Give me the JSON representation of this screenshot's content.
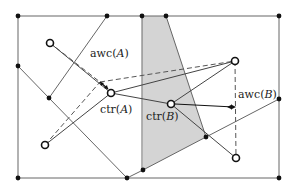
{
  "figure": {
    "colors": {
      "line": "#666666",
      "dark_line": "#444444",
      "shade": "#d4d4d4",
      "dot": "#111111",
      "label": "#222222"
    },
    "labels": {
      "awc_a_prefix": "awc(",
      "awc_a_var": "A",
      "awc_a_suffix": ")",
      "ctr_a_prefix": "ctr(",
      "ctr_a_var": "A",
      "ctr_a_suffix": ")",
      "ctr_b_prefix": "ctr(",
      "ctr_b_var": "B",
      "ctr_b_suffix": ")",
      "awc_b_prefix": "awc(",
      "awc_b_var": "B",
      "awc_b_suffix": ")"
    },
    "open_points": [
      {
        "name": "A-site-top-left",
        "x": 50,
        "y": 43
      },
      {
        "name": "ctr-A",
        "x": 111,
        "y": 93
      },
      {
        "name": "ctr-B",
        "x": 171,
        "y": 104
      },
      {
        "name": "B-site-top-right",
        "x": 235,
        "y": 61
      },
      {
        "name": "A-site-bottom-left",
        "x": 45,
        "y": 145
      },
      {
        "name": "B-site-bottom-right",
        "x": 236,
        "y": 158
      }
    ],
    "filled_points": [
      {
        "x": 18,
        "y": 16
      },
      {
        "x": 107,
        "y": 16
      },
      {
        "x": 142,
        "y": 16
      },
      {
        "x": 166,
        "y": 16
      },
      {
        "x": 279,
        "y": 16
      },
      {
        "x": 18,
        "y": 66
      },
      {
        "x": 49,
        "y": 98
      },
      {
        "x": 279,
        "y": 99
      },
      {
        "x": 18,
        "y": 178
      },
      {
        "x": 127,
        "y": 178
      },
      {
        "x": 143,
        "y": 170
      },
      {
        "x": 206,
        "y": 137
      },
      {
        "x": 279,
        "y": 178
      }
    ]
  }
}
